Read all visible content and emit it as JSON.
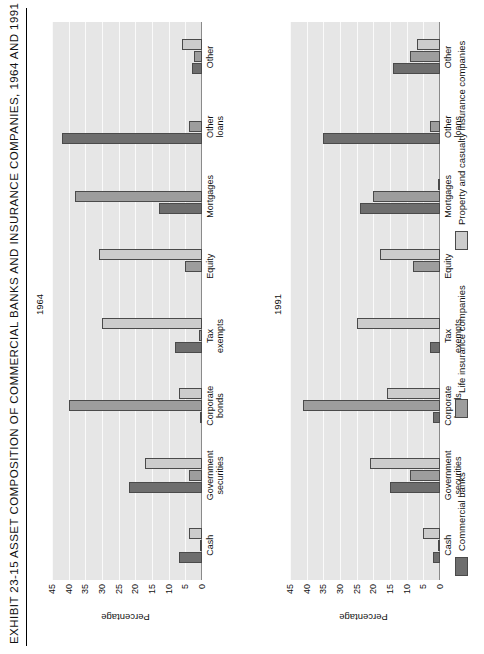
{
  "exhibit": {
    "title": "EXHIBIT 23-15  ASSET COMPOSITION OF COMMERCIAL BANKS AND INSURANCE COMPANIES, 1964 AND 1991"
  },
  "legend": {
    "items": [
      {
        "label": "Commercial banks",
        "color": "#6e6e6e"
      },
      {
        "label": "Life insurance companies",
        "color": "#9d9d9d"
      },
      {
        "label": "Property and casualty insurance companies",
        "color": "#cccccc"
      }
    ]
  },
  "axis": {
    "ylabel": "Percentage",
    "ticks": [
      "0",
      "5",
      "10",
      "15",
      "20",
      "25",
      "30",
      "35",
      "40",
      "45"
    ]
  },
  "panels": [
    {
      "label": "1964"
    },
    {
      "label": "1991"
    }
  ],
  "chart_data": [
    {
      "type": "bar",
      "title": "1964",
      "xlabel": "",
      "ylabel": "Percentage",
      "ylim": [
        0,
        45
      ],
      "grid": true,
      "legend_position": "right",
      "categories": [
        "Cash",
        "Government securities",
        "Corporate bonds",
        "Tax exempts",
        "Equity",
        "Mortgages",
        "Other loans",
        "Other"
      ],
      "series": [
        {
          "name": "Commercial banks",
          "color": "#6e6e6e",
          "values": [
            7,
            22,
            0.5,
            8,
            0,
            13,
            42,
            3
          ]
        },
        {
          "name": "Life insurance companies",
          "color": "#9d9d9d",
          "values": [
            0.5,
            4,
            40,
            1,
            5,
            38,
            4,
            2.5
          ]
        },
        {
          "name": "Property and casualty insurance companies",
          "color": "#cccccc",
          "values": [
            4,
            17,
            7,
            30,
            31,
            0,
            0,
            6
          ]
        }
      ]
    },
    {
      "type": "bar",
      "title": "1991",
      "xlabel": "",
      "ylabel": "Percentage",
      "ylim": [
        0,
        45
      ],
      "grid": true,
      "legend_position": "right",
      "categories": [
        "Cash",
        "Government securities",
        "Corporate bonds",
        "Tax exempts",
        "Equity",
        "Mortgages",
        "Other loans",
        "Other"
      ],
      "series": [
        {
          "name": "Commercial banks",
          "color": "#6e6e6e",
          "values": [
            2,
            15,
            2,
            3,
            0,
            24,
            35,
            14
          ]
        },
        {
          "name": "Life insurance companies",
          "color": "#9d9d9d",
          "values": [
            0.5,
            9,
            41,
            0,
            8,
            20,
            3,
            9
          ]
        },
        {
          "name": "Property and casualty insurance companies",
          "color": "#cccccc",
          "values": [
            5,
            21,
            16,
            25,
            18,
            0.5,
            0,
            7
          ]
        }
      ]
    }
  ],
  "category_lines": {
    "Cash": [
      "Cash"
    ],
    "Government securities": [
      "Government",
      "securities"
    ],
    "Corporate bonds": [
      "Corporate",
      "bonds"
    ],
    "Tax exempts": [
      "Tax",
      "exempts"
    ],
    "Equity": [
      "Equity"
    ],
    "Mortgages": [
      "Mortgages"
    ],
    "Other loans": [
      "Other",
      "loans"
    ],
    "Other": [
      "Other"
    ]
  }
}
